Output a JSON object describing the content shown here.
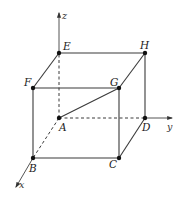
{
  "diagram": {
    "type": "cube-3d-coordinate-system",
    "colors": {
      "line": "#3a3a3a",
      "vertex": "#111111",
      "text": "#222222",
      "background": "#ffffff"
    },
    "axes": {
      "z": {
        "label": "z",
        "from": [
          59,
          118
        ],
        "to": [
          59,
          13
        ]
      },
      "y": {
        "label": "y",
        "from": [
          145,
          118
        ],
        "to": [
          172,
          118
        ]
      },
      "x": {
        "label": "x",
        "from": [
          33,
          158
        ],
        "to": [
          16,
          187
        ]
      }
    },
    "vertices": {
      "A": {
        "label": "A",
        "pos": [
          59,
          118
        ]
      },
      "B": {
        "label": "B",
        "pos": [
          33,
          158
        ]
      },
      "C": {
        "label": "C",
        "pos": [
          119,
          158
        ]
      },
      "D": {
        "label": "D",
        "pos": [
          145,
          118
        ]
      },
      "E": {
        "label": "E",
        "pos": [
          59,
          53
        ]
      },
      "F": {
        "label": "F",
        "pos": [
          33,
          88
        ]
      },
      "G": {
        "label": "G",
        "pos": [
          119,
          88
        ]
      },
      "H": {
        "label": "H",
        "pos": [
          145,
          53
        ]
      }
    },
    "solid_edges": [
      "EH",
      "FG",
      "EF",
      "GH",
      "FB",
      "GC",
      "HD",
      "BC",
      "CD",
      "AG"
    ],
    "dashed_edges": [
      "AE",
      "AB",
      "AD"
    ]
  }
}
